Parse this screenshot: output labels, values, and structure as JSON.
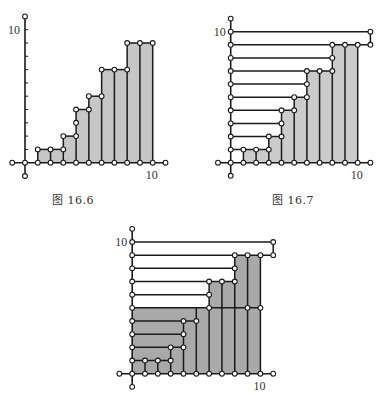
{
  "figures": [
    {
      "id": "fig-16-6",
      "caption": "图 16.6",
      "caption_pos": [
        52,
        198
      ],
      "origin": [
        25,
        162.7
      ],
      "unit_x": 12.77,
      "unit_y": 13.3,
      "fill": "#c6c6c6",
      "x_label": "10",
      "y_label": "10",
      "axis_points": [
        [
          -1,
          0
        ],
        [
          0,
          0
        ],
        [
          1,
          0
        ],
        [
          2,
          0
        ],
        [
          3,
          0
        ],
        [
          4,
          0
        ],
        [
          5,
          0
        ],
        [
          6,
          0
        ],
        [
          7,
          0
        ],
        [
          8,
          0
        ],
        [
          9,
          0
        ],
        [
          10,
          0
        ],
        [
          11,
          0
        ],
        [
          0,
          11
        ],
        [
          0,
          -1
        ]
      ],
      "y_ticks": [
        1,
        2,
        3,
        4,
        5,
        6,
        7,
        8,
        9,
        10
      ],
      "filled_polygons": [
        [
          [
            1,
            0
          ],
          [
            1,
            1
          ],
          [
            3,
            1
          ],
          [
            3,
            2
          ],
          [
            4,
            2
          ],
          [
            4,
            4
          ],
          [
            5,
            4
          ],
          [
            5,
            5
          ],
          [
            6,
            5
          ],
          [
            6,
            7
          ],
          [
            8,
            7
          ],
          [
            8,
            9
          ],
          [
            10,
            9
          ],
          [
            10,
            0
          ]
        ]
      ],
      "segments": [
        [
          [
            1,
            0
          ],
          [
            1,
            1
          ]
        ],
        [
          [
            1,
            1
          ],
          [
            3,
            1
          ]
        ],
        [
          [
            2,
            0
          ],
          [
            2,
            1
          ]
        ],
        [
          [
            3,
            0
          ],
          [
            3,
            2
          ]
        ],
        [
          [
            3,
            2
          ],
          [
            4,
            2
          ]
        ],
        [
          [
            4,
            0
          ],
          [
            4,
            4
          ]
        ],
        [
          [
            4,
            4
          ],
          [
            5,
            4
          ]
        ],
        [
          [
            5,
            0
          ],
          [
            5,
            5
          ]
        ],
        [
          [
            5,
            5
          ],
          [
            6,
            5
          ]
        ],
        [
          [
            6,
            0
          ],
          [
            6,
            7
          ]
        ],
        [
          [
            6,
            7
          ],
          [
            8,
            7
          ]
        ],
        [
          [
            7,
            0
          ],
          [
            7,
            7
          ]
        ],
        [
          [
            8,
            0
          ],
          [
            8,
            9
          ]
        ],
        [
          [
            8,
            9
          ],
          [
            10,
            9
          ]
        ],
        [
          [
            9,
            0
          ],
          [
            9,
            9
          ]
        ],
        [
          [
            10,
            0
          ],
          [
            10,
            9
          ]
        ]
      ],
      "points": [
        [
          1,
          1
        ],
        [
          2,
          1
        ],
        [
          3,
          1
        ],
        [
          3,
          2
        ],
        [
          4,
          2
        ],
        [
          4,
          3
        ],
        [
          4,
          4
        ],
        [
          5,
          4
        ],
        [
          5,
          5
        ],
        [
          6,
          5
        ],
        [
          6,
          7
        ],
        [
          7,
          7
        ],
        [
          8,
          7
        ],
        [
          8,
          9
        ],
        [
          9,
          9
        ],
        [
          10,
          9
        ]
      ]
    },
    {
      "id": "fig-16-7",
      "caption": "图 16.7",
      "caption_pos": [
        275,
        198
      ],
      "origin": [
        230.7,
        162.7
      ],
      "unit_x": 12.7,
      "unit_y": 13.1,
      "fill": "#cbcbcb",
      "x_label": "10",
      "y_label": "10",
      "axis_points": [
        [
          -1,
          0
        ],
        [
          0,
          0
        ],
        [
          1,
          0
        ],
        [
          2,
          0
        ],
        [
          3,
          0
        ],
        [
          4,
          0
        ],
        [
          5,
          0
        ],
        [
          6,
          0
        ],
        [
          7,
          0
        ],
        [
          8,
          0
        ],
        [
          9,
          0
        ],
        [
          10,
          0
        ],
        [
          11,
          0
        ],
        [
          0,
          1
        ],
        [
          0,
          2
        ],
        [
          0,
          3
        ],
        [
          0,
          4
        ],
        [
          0,
          5
        ],
        [
          0,
          6
        ],
        [
          0,
          7
        ],
        [
          0,
          8
        ],
        [
          0,
          9
        ],
        [
          0,
          10
        ],
        [
          0,
          11
        ],
        [
          0,
          -1
        ]
      ],
      "y_ticks": [],
      "filled_polygons": [
        [
          [
            1,
            0
          ],
          [
            1,
            1
          ],
          [
            3,
            1
          ],
          [
            3,
            2
          ],
          [
            4,
            2
          ],
          [
            4,
            4
          ],
          [
            5,
            4
          ],
          [
            5,
            5
          ],
          [
            6,
            5
          ],
          [
            6,
            7
          ],
          [
            8,
            7
          ],
          [
            8,
            9
          ],
          [
            10,
            9
          ],
          [
            10,
            0
          ]
        ]
      ],
      "segments": [
        [
          [
            0,
            10
          ],
          [
            11,
            10
          ]
        ],
        [
          [
            11,
            10
          ],
          [
            11,
            9
          ]
        ],
        [
          [
            0,
            9
          ],
          [
            11,
            9
          ]
        ],
        [
          [
            0,
            8
          ],
          [
            8,
            8
          ]
        ],
        [
          [
            0,
            7
          ],
          [
            8,
            7
          ]
        ],
        [
          [
            0,
            6
          ],
          [
            6,
            6
          ]
        ],
        [
          [
            0,
            5
          ],
          [
            6,
            5
          ]
        ],
        [
          [
            0,
            4
          ],
          [
            5,
            4
          ]
        ],
        [
          [
            0,
            3
          ],
          [
            4,
            3
          ]
        ],
        [
          [
            0,
            2
          ],
          [
            4,
            2
          ]
        ],
        [
          [
            0,
            1
          ],
          [
            3,
            1
          ]
        ],
        [
          [
            1,
            0
          ],
          [
            1,
            1
          ]
        ],
        [
          [
            2,
            0
          ],
          [
            2,
            1
          ]
        ],
        [
          [
            3,
            0
          ],
          [
            3,
            2
          ]
        ],
        [
          [
            4,
            0
          ],
          [
            4,
            4
          ]
        ],
        [
          [
            5,
            0
          ],
          [
            5,
            5
          ]
        ],
        [
          [
            6,
            0
          ],
          [
            6,
            7
          ]
        ],
        [
          [
            7,
            0
          ],
          [
            7,
            7
          ]
        ],
        [
          [
            8,
            0
          ],
          [
            8,
            9
          ]
        ],
        [
          [
            9,
            0
          ],
          [
            9,
            9
          ]
        ],
        [
          [
            10,
            0
          ],
          [
            10,
            9
          ]
        ]
      ],
      "points": [
        [
          11,
          10
        ],
        [
          11,
          9
        ],
        [
          8,
          9
        ],
        [
          9,
          9
        ],
        [
          10,
          9
        ],
        [
          8,
          8
        ],
        [
          6,
          7
        ],
        [
          7,
          7
        ],
        [
          8,
          7
        ],
        [
          6,
          6
        ],
        [
          5,
          5
        ],
        [
          6,
          5
        ],
        [
          4,
          4
        ],
        [
          5,
          4
        ],
        [
          4,
          3
        ],
        [
          3,
          2
        ],
        [
          4,
          2
        ],
        [
          1,
          1
        ],
        [
          2,
          1
        ],
        [
          3,
          1
        ]
      ]
    },
    {
      "id": "fig-16-8",
      "caption": "",
      "caption_pos": [
        0,
        0
      ],
      "origin": [
        132.2,
        373.7
      ],
      "unit_x": 12.82,
      "unit_y": 13.17,
      "fill": "#a9a9a9",
      "x_label": "10",
      "y_label": "10",
      "axis_points": [
        [
          -1,
          0
        ],
        [
          0,
          0
        ],
        [
          1,
          0
        ],
        [
          2,
          0
        ],
        [
          3,
          0
        ],
        [
          4,
          0
        ],
        [
          5,
          0
        ],
        [
          6,
          0
        ],
        [
          7,
          0
        ],
        [
          8,
          0
        ],
        [
          9,
          0
        ],
        [
          10,
          0
        ],
        [
          11,
          0
        ],
        [
          0,
          1
        ],
        [
          0,
          2
        ],
        [
          0,
          3
        ],
        [
          0,
          4
        ],
        [
          0,
          5
        ],
        [
          0,
          6
        ],
        [
          0,
          7
        ],
        [
          0,
          8
        ],
        [
          0,
          9
        ],
        [
          0,
          10
        ],
        [
          0,
          11
        ],
        [
          0,
          -1
        ]
      ],
      "y_ticks": [],
      "filled_polygons": [
        [
          [
            0,
            0
          ],
          [
            0,
            5
          ],
          [
            6,
            5
          ],
          [
            6,
            7
          ],
          [
            8,
            7
          ],
          [
            8,
            9
          ],
          [
            10,
            9
          ],
          [
            10,
            0
          ]
        ]
      ],
      "segments": [
        [
          [
            0,
            10
          ],
          [
            11,
            10
          ]
        ],
        [
          [
            11,
            10
          ],
          [
            11,
            9
          ]
        ],
        [
          [
            0,
            9
          ],
          [
            11,
            9
          ]
        ],
        [
          [
            0,
            8
          ],
          [
            8,
            8
          ]
        ],
        [
          [
            0,
            7
          ],
          [
            8,
            7
          ]
        ],
        [
          [
            0,
            6
          ],
          [
            6,
            6
          ]
        ],
        [
          [
            0,
            5
          ],
          [
            10,
            5
          ]
        ],
        [
          [
            0,
            4
          ],
          [
            5,
            4
          ]
        ],
        [
          [
            0,
            3
          ],
          [
            4,
            3
          ]
        ],
        [
          [
            0,
            2
          ],
          [
            4,
            2
          ]
        ],
        [
          [
            0,
            1
          ],
          [
            3,
            1
          ]
        ],
        [
          [
            1,
            0
          ],
          [
            1,
            1
          ]
        ],
        [
          [
            2,
            0
          ],
          [
            2,
            1
          ]
        ],
        [
          [
            3,
            0
          ],
          [
            3,
            2
          ]
        ],
        [
          [
            4,
            0
          ],
          [
            4,
            4
          ]
        ],
        [
          [
            5,
            0
          ],
          [
            5,
            5
          ]
        ],
        [
          [
            6,
            0
          ],
          [
            6,
            7
          ]
        ],
        [
          [
            7,
            0
          ],
          [
            7,
            7
          ]
        ],
        [
          [
            8,
            0
          ],
          [
            8,
            9
          ]
        ],
        [
          [
            9,
            0
          ],
          [
            9,
            9
          ]
        ],
        [
          [
            10,
            0
          ],
          [
            10,
            9
          ]
        ]
      ],
      "points": [
        [
          11,
          10
        ],
        [
          11,
          9
        ],
        [
          8,
          9
        ],
        [
          9,
          9
        ],
        [
          10,
          9
        ],
        [
          8,
          8
        ],
        [
          6,
          7
        ],
        [
          7,
          7
        ],
        [
          8,
          7
        ],
        [
          6,
          6
        ],
        [
          6,
          5
        ],
        [
          9,
          5
        ],
        [
          10,
          5
        ],
        [
          4,
          4
        ],
        [
          5,
          4
        ],
        [
          4,
          3
        ],
        [
          3,
          2
        ],
        [
          4,
          2
        ],
        [
          1,
          1
        ],
        [
          2,
          1
        ],
        [
          3,
          1
        ]
      ]
    }
  ],
  "style": {
    "line_color": "#1a1a1a",
    "point_fill": "#ffffff",
    "point_stroke": "#1a1a1a",
    "text_color": "#333333"
  }
}
